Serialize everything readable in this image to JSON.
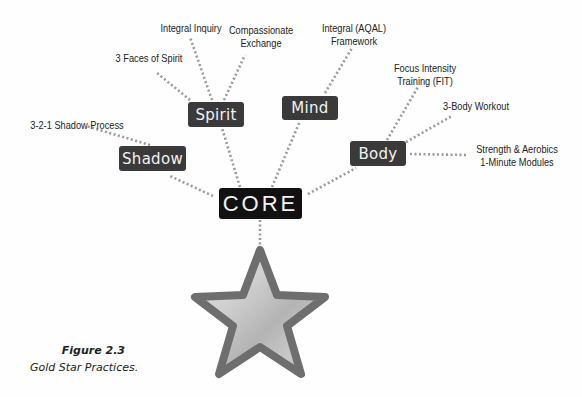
{
  "diagram": {
    "core": {
      "label": "CORE"
    },
    "categories": [
      {
        "label": "Spirit"
      },
      {
        "label": "Mind"
      },
      {
        "label": "Shadow"
      },
      {
        "label": "Body"
      }
    ],
    "practices": {
      "spirit": [
        "3 Faces of Spirit",
        "Integral Inquiry",
        "Compassionate\nExchange"
      ],
      "mind": [
        "Integral (AQAL)\nFramework"
      ],
      "shadow": [
        "3-2-1 Shadow Process"
      ],
      "body": [
        "Focus Intensity\nTraining (FIT)",
        "3-Body Workout",
        "Strength & Aerobics\n1-Minute Modules"
      ]
    },
    "labels": {
      "faces": "3 Faces of Spirit",
      "inquiry": "Integral Inquiry",
      "compassion_1": "Compassionate",
      "compassion_2": "Exchange",
      "aqal_1": "Integral (AQAL)",
      "aqal_2": "Framework",
      "shadow_proc": "3-2-1 Shadow Process",
      "fit_1": "Focus Intensity",
      "fit_2": "Training (FIT)",
      "workout": "3-Body Workout",
      "strength_1": "Strength & Aerobics",
      "strength_2": "1-Minute Modules"
    },
    "symbol": "gold-star"
  },
  "caption": {
    "title": "Figure 2.3",
    "subtitle": "Gold Star Practices."
  },
  "colors": {
    "node_bg": "#3a3a3a",
    "core_bg": "#111111",
    "dots": "#9a9a9a",
    "star_outline": "#6e6e6e"
  }
}
